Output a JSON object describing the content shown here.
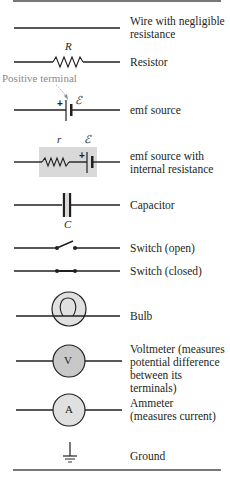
{
  "annotation": "Positive terminal",
  "symbols": [
    {
      "name": "wire",
      "label": "Wire with negligible resistance",
      "lines": [
        "Wire with negligible",
        "resistance"
      ]
    },
    {
      "name": "resistor",
      "label": "Resistor",
      "variable": "R"
    },
    {
      "name": "emf-source",
      "label": "emf source",
      "variable": "ℰ",
      "sign": "+"
    },
    {
      "name": "emf-source-internal",
      "label": "emf source with internal resistance",
      "lines": [
        "emf source with",
        "internal resistance"
      ],
      "variables": [
        "r",
        "ℰ"
      ],
      "sign": "+"
    },
    {
      "name": "capacitor",
      "label": "Capacitor",
      "variable": "C"
    },
    {
      "name": "switch-open",
      "label": "Switch (open)"
    },
    {
      "name": "switch-closed",
      "label": "Switch (closed)"
    },
    {
      "name": "bulb",
      "label": "Bulb"
    },
    {
      "name": "voltmeter",
      "label": "Voltmeter (measures potential difference between its terminals)",
      "lines": [
        "Voltmeter (measures",
        "potential difference",
        "between its terminals)"
      ],
      "glyph": "V"
    },
    {
      "name": "ammeter",
      "label": "Ammeter (measures current)",
      "lines": [
        "Ammeter",
        "(measures current)"
      ],
      "glyph": "A"
    },
    {
      "name": "ground",
      "label": "Ground"
    }
  ],
  "colors": {
    "line": "#231f20",
    "fill_gray": "#d9d9d9",
    "annotation_gray": "#8a8a8a"
  }
}
